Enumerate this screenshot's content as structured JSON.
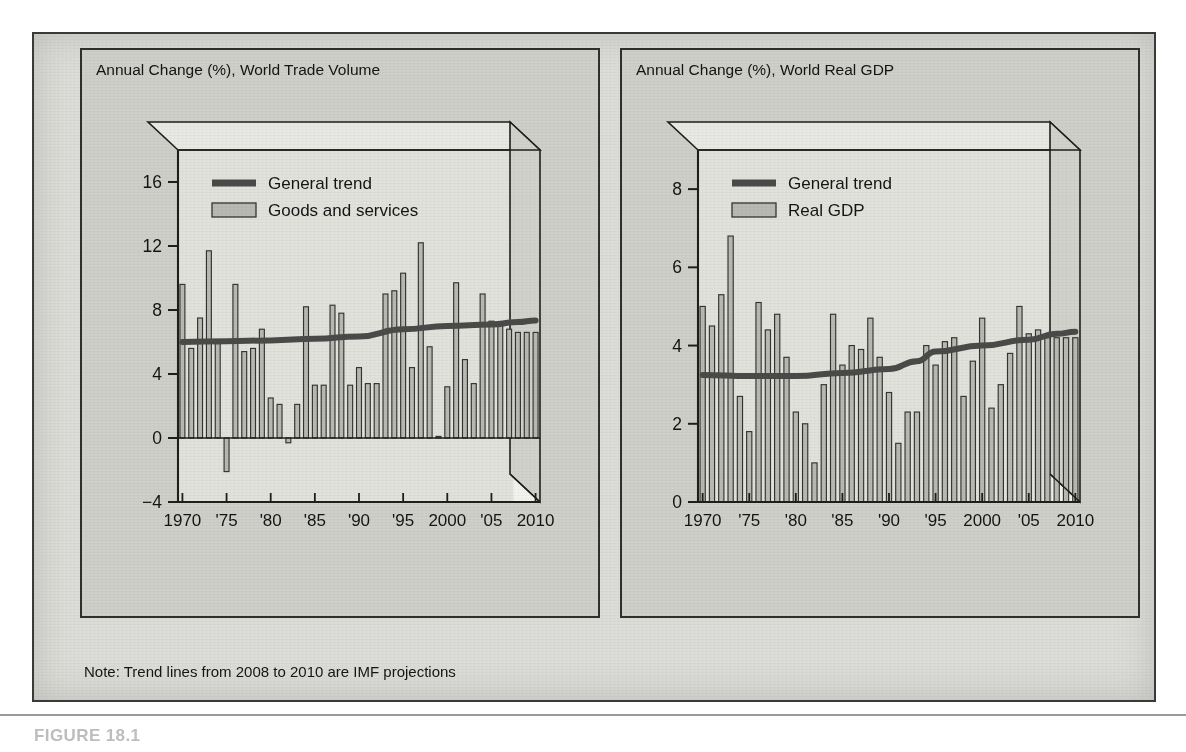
{
  "credit": {
    "outer_label": "International Monetary Fund",
    "inner_axis_label": "International Monitory Fund"
  },
  "note": {
    "text": "Note: Trend lines from 2008 to 2010 are IMF projections"
  },
  "caption": {
    "text": "FIGURE 18.1"
  },
  "colors": {
    "figure_background": "#dcdcd8",
    "panel_background": "#cfcfca",
    "plot_area": "#e2e2dd",
    "projection_area": "#f2f2ef",
    "bar_fill": "#b9b9b4",
    "bar_stroke": "#333331",
    "trend_line": "#4a4a48",
    "axis": "#1e1e1c",
    "text": "#141414"
  },
  "chart_data": [
    {
      "type": "bar",
      "panel": "left",
      "title": "Annual Change (%), World Trade Volume",
      "xlabel": "",
      "ylabel": "",
      "ylim": [
        -4,
        18
      ],
      "yticks": [
        -4,
        0,
        4,
        8,
        12,
        16
      ],
      "ytick_labels": [
        "−4",
        "0",
        "4",
        "8",
        "12",
        "16"
      ],
      "grid": false,
      "legend_position": "top-left",
      "legend": [
        {
          "label": "General trend",
          "marker": "line"
        },
        {
          "label": "Goods and services",
          "marker": "bar"
        }
      ],
      "xticks": [
        1970,
        1975,
        1980,
        1985,
        1990,
        1995,
        2000,
        2005,
        2010
      ],
      "xtick_labels": [
        "1970",
        "'75",
        "'80",
        "'85",
        "'90",
        "'95",
        "2000",
        "'05",
        "2010"
      ],
      "x": [
        1970,
        1971,
        1972,
        1973,
        1974,
        1975,
        1976,
        1977,
        1978,
        1979,
        1980,
        1981,
        1982,
        1983,
        1984,
        1985,
        1986,
        1987,
        1988,
        1989,
        1990,
        1991,
        1992,
        1993,
        1994,
        1995,
        1996,
        1997,
        1998,
        1999,
        2000,
        2001,
        2002,
        2003,
        2004,
        2005,
        2006,
        2007,
        2008,
        2009,
        2010
      ],
      "series": [
        {
          "name": "Goods and services",
          "values": [
            9.6,
            5.6,
            7.5,
            11.7,
            5.9,
            -2.1,
            9.6,
            5.4,
            5.6,
            6.8,
            2.5,
            2.1,
            -0.3,
            2.1,
            8.2,
            3.3,
            3.3,
            8.3,
            7.8,
            3.3,
            4.4,
            3.4,
            3.4,
            9.0,
            9.2,
            10.3,
            4.4,
            12.2,
            5.7,
            0.1,
            3.2,
            9.7,
            4.9,
            3.4,
            9.0,
            7.3,
            7.1,
            6.8,
            6.6,
            6.6,
            6.6
          ]
        }
      ],
      "trend": {
        "name": "General trend",
        "x": [
          1970,
          1975,
          1980,
          1985,
          1990,
          1995,
          2000,
          2005,
          2008,
          2010
        ],
        "values": [
          6.0,
          6.05,
          6.1,
          6.2,
          6.35,
          6.8,
          7.0,
          7.1,
          7.25,
          7.35
        ],
        "projection_from": 2008
      }
    },
    {
      "type": "bar",
      "panel": "right",
      "title": "Annual Change (%), World Real GDP",
      "xlabel": "",
      "ylabel": "",
      "ylim": [
        0,
        9
      ],
      "yticks": [
        0,
        2,
        4,
        6,
        8
      ],
      "ytick_labels": [
        "0",
        "2",
        "4",
        "6",
        "8"
      ],
      "grid": false,
      "legend_position": "top-left",
      "legend": [
        {
          "label": "General trend",
          "marker": "line"
        },
        {
          "label": "Real GDP",
          "marker": "bar"
        }
      ],
      "xticks": [
        1970,
        1975,
        1980,
        1985,
        1990,
        1995,
        2000,
        2005,
        2010
      ],
      "xtick_labels": [
        "1970",
        "'75",
        "'80",
        "'85",
        "'90",
        "'95",
        "2000",
        "'05",
        "2010"
      ],
      "x": [
        1970,
        1971,
        1972,
        1973,
        1974,
        1975,
        1976,
        1977,
        1978,
        1979,
        1980,
        1981,
        1982,
        1983,
        1984,
        1985,
        1986,
        1987,
        1988,
        1989,
        1990,
        1991,
        1992,
        1993,
        1994,
        1995,
        1996,
        1997,
        1998,
        1999,
        2000,
        2001,
        2002,
        2003,
        2004,
        2005,
        2006,
        2007,
        2008,
        2009,
        2010
      ],
      "series": [
        {
          "name": "Real GDP",
          "values": [
            5.0,
            4.5,
            5.3,
            6.8,
            2.7,
            1.8,
            5.1,
            4.4,
            4.8,
            3.7,
            2.3,
            2.0,
            1.0,
            3.0,
            4.8,
            3.5,
            4.0,
            3.9,
            4.7,
            3.7,
            2.8,
            1.5,
            2.3,
            2.3,
            4.0,
            3.5,
            4.1,
            4.2,
            2.7,
            3.6,
            4.7,
            2.4,
            3.0,
            3.8,
            5.0,
            4.3,
            4.4,
            4.2,
            4.2,
            4.2,
            4.2
          ]
        }
      ],
      "trend": {
        "name": "General trend",
        "x": [
          1970,
          1975,
          1980,
          1985,
          1990,
          1993,
          1995,
          2000,
          2005,
          2008,
          2010
        ],
        "values": [
          3.25,
          3.22,
          3.22,
          3.3,
          3.4,
          3.6,
          3.85,
          4.0,
          4.15,
          4.3,
          4.35
        ],
        "projection_from": 2008
      }
    }
  ]
}
